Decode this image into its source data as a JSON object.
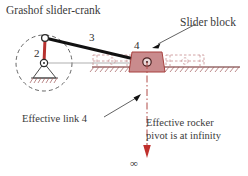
{
  "figure": {
    "title": "Grashof slider-crank",
    "type": "kinematic-linkage-diagram"
  },
  "labels": {
    "title": "Grashof slider-crank",
    "slider_block": "Slider block",
    "effective_link_4": "Effective link 4",
    "effective_rocker_line1": "Effective rocker",
    "effective_rocker_line2": "pivot is at infinity",
    "infinity_symbol": "∞",
    "link2_number": "2",
    "link3_number": "3",
    "link4_number": "4"
  },
  "colors": {
    "crank_red": "#b7322f",
    "slider_fill": "#c98b8d",
    "slider_stroke": "#a8413f",
    "coupler_black": "#111111",
    "text_gray": "#3a3a3a",
    "dash_gray": "#555555",
    "rail_gray": "#8e8e8e",
    "phantom_pink": "#c78d8f",
    "arrow_red": "#c0302c",
    "background": "#ffffff"
  },
  "geometry": {
    "crank_pivot": {
      "x": 44,
      "y": 63,
      "label": "ground-pivot-O2"
    },
    "crank_pin": {
      "x": 45,
      "y": 38,
      "label": "crank-pin-A"
    },
    "slider_pin": {
      "x": 147,
      "y": 62,
      "label": "slider-pin-B"
    },
    "crank_circle": {
      "cx": 44,
      "cy": 63,
      "r": 28,
      "style": "dashed"
    },
    "effective_link_line": {
      "x": 147,
      "y_top": 62,
      "y_bottom": 158,
      "style": "dash-dot"
    },
    "slider_travel_rail_y": 67
  },
  "annotations": [
    {
      "name": "slider-block-leader",
      "from": [
        196,
        24
      ],
      "to": [
        152,
        48
      ],
      "target": "slider block"
    },
    {
      "name": "effective-link4-leader",
      "from": [
        104,
        117
      ],
      "to": [
        140,
        96
      ],
      "target": "effective link 4 dash-dot line"
    }
  ]
}
